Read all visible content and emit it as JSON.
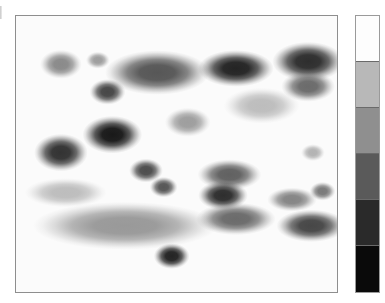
{
  "figure": {
    "kind": "gel-blot-heatmap",
    "background_color": "#ffffff",
    "panel_fill": "#fbfbfb",
    "panel_border_color": "#8e8e8e",
    "edge_tick_label": "left-edge-tick"
  },
  "chart_data": {
    "type": "heatmap",
    "title": "",
    "subtitle": "",
    "xlabel": "",
    "ylabel": "",
    "grid": false,
    "legend_position": "right",
    "axis_ticks_visible": false,
    "xlim": [
      0,
      100
    ],
    "ylim": [
      0,
      100
    ],
    "value_scale": {
      "description": "grayscale intensity, 0 = white (no signal), 1 = black (max signal)",
      "min": 0,
      "max": 1
    },
    "colorbar": {
      "orientation": "vertical",
      "bands": 5,
      "band_colors": [
        "#fdfdfd",
        "#b8b8b8",
        "#8f8f8f",
        "#5a5a5a",
        "#2a2a2a",
        "#0a0a0a"
      ],
      "tick_labels": []
    },
    "spots": [
      {
        "id": "s01",
        "cx": 14.0,
        "cy": 17.5,
        "rx": 4.2,
        "ry": 3.4,
        "intensity": 0.46
      },
      {
        "id": "s02",
        "cx": 25.5,
        "cy": 16.0,
        "rx": 2.4,
        "ry": 2.0,
        "intensity": 0.38
      },
      {
        "id": "s03",
        "cx": 28.5,
        "cy": 27.5,
        "rx": 3.6,
        "ry": 3.0,
        "intensity": 0.72
      },
      {
        "id": "s04",
        "cx": 44.0,
        "cy": 20.5,
        "rx": 10.5,
        "ry": 5.2,
        "intensity": 0.66
      },
      {
        "id": "s05",
        "cx": 68.5,
        "cy": 19.0,
        "rx": 7.6,
        "ry": 4.3,
        "intensity": 0.86
      },
      {
        "id": "s06",
        "cx": 91.0,
        "cy": 16.5,
        "rx": 7.2,
        "ry": 4.6,
        "intensity": 0.82
      },
      {
        "id": "s07",
        "cx": 91.0,
        "cy": 25.5,
        "rx": 5.4,
        "ry": 3.6,
        "intensity": 0.58
      },
      {
        "id": "s08",
        "cx": 76.5,
        "cy": 32.5,
        "rx": 7.6,
        "ry": 4.2,
        "intensity": 0.26
      },
      {
        "id": "s09",
        "cx": 53.5,
        "cy": 38.5,
        "rx": 4.6,
        "ry": 3.4,
        "intensity": 0.38
      },
      {
        "id": "s10",
        "cx": 30.0,
        "cy": 43.0,
        "rx": 6.0,
        "ry": 4.4,
        "intensity": 0.9
      },
      {
        "id": "s11",
        "cx": 14.0,
        "cy": 49.5,
        "rx": 5.4,
        "ry": 4.4,
        "intensity": 0.8
      },
      {
        "id": "s12",
        "cx": 92.5,
        "cy": 49.5,
        "rx": 2.4,
        "ry": 2.0,
        "intensity": 0.3
      },
      {
        "id": "s13",
        "cx": 40.5,
        "cy": 56.0,
        "rx": 3.4,
        "ry": 2.8,
        "intensity": 0.7
      },
      {
        "id": "s14",
        "cx": 46.0,
        "cy": 62.0,
        "rx": 2.8,
        "ry": 2.4,
        "intensity": 0.66
      },
      {
        "id": "s15",
        "cx": 66.5,
        "cy": 57.5,
        "rx": 6.4,
        "ry": 3.6,
        "intensity": 0.62
      },
      {
        "id": "s16",
        "cx": 64.5,
        "cy": 65.0,
        "rx": 5.0,
        "ry": 3.4,
        "intensity": 0.82
      },
      {
        "id": "s17",
        "cx": 68.5,
        "cy": 73.5,
        "rx": 8.0,
        "ry": 3.8,
        "intensity": 0.58
      },
      {
        "id": "s18",
        "cx": 15.5,
        "cy": 64.0,
        "rx": 8.2,
        "ry": 3.4,
        "intensity": 0.26
      },
      {
        "id": "s19",
        "cx": 34.0,
        "cy": 76.0,
        "rx": 18.5,
        "ry": 5.6,
        "intensity": 0.4
      },
      {
        "id": "s20",
        "cx": 48.5,
        "cy": 87.0,
        "rx": 3.6,
        "ry": 3.0,
        "intensity": 0.86
      },
      {
        "id": "s21",
        "cx": 86.0,
        "cy": 66.5,
        "rx": 5.0,
        "ry": 2.8,
        "intensity": 0.48
      },
      {
        "id": "s22",
        "cx": 95.5,
        "cy": 63.5,
        "rx": 2.6,
        "ry": 2.2,
        "intensity": 0.52
      },
      {
        "id": "s23",
        "cx": 92.0,
        "cy": 76.0,
        "rx": 7.0,
        "ry": 3.8,
        "intensity": 0.72
      }
    ]
  }
}
